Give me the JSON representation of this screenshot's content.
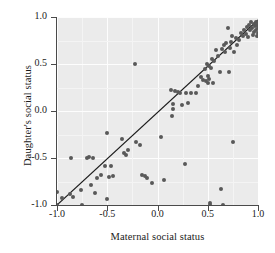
{
  "chart_data": {
    "type": "scatter",
    "title": "",
    "xlabel": "Maternal social status",
    "ylabel": "Daughter's social status",
    "xlim": [
      -1.0,
      1.0
    ],
    "ylim": [
      -1.0,
      1.0
    ],
    "xticks": [
      "-1.0",
      "-0.5",
      "0.0",
      "0.5",
      "1.0"
    ],
    "xtickvalues": [
      -1.0,
      -0.5,
      0.0,
      0.5,
      1.0
    ],
    "yticks": [
      "-1.0",
      "-0.5",
      "0.0",
      "0.5",
      "1.0"
    ],
    "ytickvalues": [
      -1.0,
      -0.5,
      0.0,
      0.5,
      1.0
    ],
    "grid": true,
    "legend": "none",
    "panel_color": "#ebebeb",
    "grid_color": "#fdfdfd",
    "point_color": "#595959",
    "line_color": "#1a1a1a",
    "fit_line": {
      "x": [
        -1.0,
        1.0
      ],
      "y": [
        -1.0,
        0.97
      ],
      "slope": 0.985,
      "intercept": -0.015
    },
    "points": [
      [
        -1.0,
        -0.86
      ],
      [
        -1.0,
        -1.0
      ],
      [
        -0.95,
        -0.93
      ],
      [
        -0.87,
        -0.88
      ],
      [
        -0.86,
        -0.5
      ],
      [
        -0.84,
        -0.92
      ],
      [
        -0.76,
        -0.84
      ],
      [
        -0.75,
        -1.0
      ],
      [
        -0.7,
        -0.5
      ],
      [
        -0.68,
        -0.49
      ],
      [
        -0.66,
        -0.79
      ],
      [
        -0.64,
        -0.5
      ],
      [
        -0.62,
        -0.87
      ],
      [
        -0.6,
        -0.71
      ],
      [
        -0.56,
        -0.68
      ],
      [
        -0.52,
        -0.58
      ],
      [
        -0.5,
        -0.23
      ],
      [
        -0.5,
        -0.94
      ],
      [
        -0.48,
        -0.7
      ],
      [
        -0.46,
        -0.58
      ],
      [
        -0.44,
        -0.69
      ],
      [
        -0.35,
        -0.3
      ],
      [
        -0.33,
        -0.45
      ],
      [
        -0.31,
        -0.47
      ],
      [
        -0.29,
        -0.41
      ],
      [
        -0.22,
        0.5
      ],
      [
        -0.21,
        -0.33
      ],
      [
        -0.17,
        -0.36
      ],
      [
        -0.15,
        -0.68
      ],
      [
        -0.12,
        -0.69
      ],
      [
        -0.1,
        -0.71
      ],
      [
        -0.05,
        -0.77
      ],
      [
        0.03,
        -0.28
      ],
      [
        0.06,
        -0.73
      ],
      [
        0.13,
        0.22
      ],
      [
        0.14,
        -0.05
      ],
      [
        0.15,
        0.07
      ],
      [
        0.15,
        0.02
      ],
      [
        0.17,
        0.21
      ],
      [
        0.2,
        0.2
      ],
      [
        0.22,
        0.19
      ],
      [
        0.24,
        0.06
      ],
      [
        0.27,
        -0.56
      ],
      [
        0.28,
        0.19
      ],
      [
        0.3,
        0.09
      ],
      [
        0.33,
        0.19
      ],
      [
        0.38,
        0.19
      ],
      [
        0.4,
        0.27
      ],
      [
        0.43,
        0.36
      ],
      [
        0.45,
        0.33
      ],
      [
        0.47,
        0.45
      ],
      [
        0.48,
        0.32
      ],
      [
        0.49,
        0.5
      ],
      [
        0.5,
        0.3
      ],
      [
        0.5,
        0.37
      ],
      [
        0.51,
        0.34
      ],
      [
        0.51,
        0.48
      ],
      [
        0.52,
        -0.98
      ],
      [
        0.52,
        -1.0
      ],
      [
        0.53,
        0.46
      ],
      [
        0.54,
        0.55
      ],
      [
        0.55,
        0.3
      ],
      [
        0.56,
        0.53
      ],
      [
        0.58,
        0.65
      ],
      [
        0.6,
        0.58
      ],
      [
        0.62,
        0.41
      ],
      [
        0.63,
        -0.83
      ],
      [
        0.64,
        0.66
      ],
      [
        0.65,
        -1.0
      ],
      [
        0.66,
        0.7
      ],
      [
        0.67,
        0.63
      ],
      [
        0.68,
        0.72
      ],
      [
        0.7,
        0.88
      ],
      [
        0.71,
        0.42
      ],
      [
        0.72,
        0.67
      ],
      [
        0.73,
        0.73
      ],
      [
        0.74,
        0.8
      ],
      [
        0.75,
        -0.33
      ],
      [
        0.76,
        0.63
      ],
      [
        0.78,
        0.78
      ],
      [
        0.79,
        0.7
      ],
      [
        0.81,
        0.76
      ],
      [
        0.83,
        0.83
      ],
      [
        0.85,
        0.8
      ],
      [
        0.86,
        0.86
      ],
      [
        0.88,
        0.82
      ],
      [
        0.89,
        0.89
      ],
      [
        0.9,
        0.79
      ],
      [
        0.91,
        0.92
      ],
      [
        0.92,
        0.86
      ],
      [
        0.93,
        0.95
      ],
      [
        0.94,
        0.88
      ],
      [
        0.95,
        0.81
      ],
      [
        0.96,
        0.93
      ],
      [
        0.96,
        0.84
      ],
      [
        0.97,
        0.9
      ],
      [
        0.98,
        0.95
      ],
      [
        0.98,
        0.86
      ],
      [
        0.99,
        0.92
      ],
      [
        0.99,
        0.8
      ],
      [
        1.0,
        0.95
      ],
      [
        1.0,
        0.88
      ],
      [
        1.0,
        0.83
      ]
    ]
  }
}
